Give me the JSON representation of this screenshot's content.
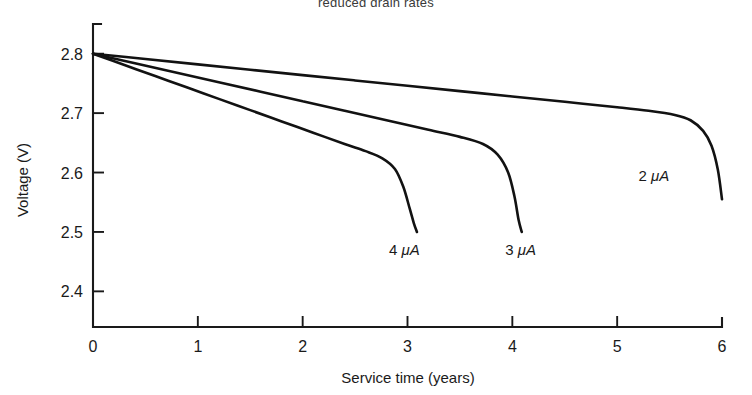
{
  "chart_data": {
    "type": "line",
    "title": "reduced drain rates",
    "xlabel": "Service time (years)",
    "ylabel": "Voltage (V)",
    "xlim": [
      0,
      6
    ],
    "ylim": [
      2.34,
      2.85
    ],
    "grid": false,
    "legend_position": "inline-annotations",
    "xticks": [
      "0",
      "1",
      "2",
      "3",
      "4",
      "5",
      "6"
    ],
    "xtick_values": [
      0,
      1,
      2,
      3,
      4,
      5,
      6
    ],
    "yticks": [
      "2.8",
      "2.7",
      "2.6",
      "2.5",
      "2.4"
    ],
    "ytick_values": [
      2.8,
      2.7,
      2.6,
      2.5,
      2.4
    ],
    "series": [
      {
        "name": "2 μA",
        "label_prefix": "2",
        "label_unit": "μA",
        "label_x": 5.35,
        "label_y": 2.585,
        "x": [
          0,
          0.5,
          1.0,
          1.5,
          2.0,
          2.5,
          3.0,
          3.5,
          4.0,
          4.5,
          5.0,
          5.3,
          5.55,
          5.7,
          5.82,
          5.9,
          5.96,
          6.0
        ],
        "values": [
          2.8,
          2.791,
          2.782,
          2.773,
          2.764,
          2.755,
          2.746,
          2.737,
          2.728,
          2.719,
          2.71,
          2.704,
          2.697,
          2.688,
          2.67,
          2.645,
          2.605,
          2.555
        ]
      },
      {
        "name": "3 μA",
        "label_prefix": "3",
        "label_unit": "μA",
        "label_x": 4.08,
        "label_y": 2.462,
        "x": [
          0,
          0.4,
          0.8,
          1.2,
          1.6,
          2.0,
          2.4,
          2.8,
          3.2,
          3.5,
          3.72,
          3.86,
          3.96,
          4.02,
          4.06,
          4.09
        ],
        "values": [
          2.8,
          2.784,
          2.768,
          2.752,
          2.736,
          2.72,
          2.704,
          2.688,
          2.672,
          2.66,
          2.648,
          2.63,
          2.6,
          2.56,
          2.52,
          2.5
        ]
      },
      {
        "name": "4 μA",
        "label_prefix": "4",
        "label_unit": "μA",
        "label_x": 2.97,
        "label_y": 2.462,
        "x": [
          0,
          0.3,
          0.6,
          0.9,
          1.2,
          1.5,
          1.8,
          2.1,
          2.4,
          2.6,
          2.76,
          2.88,
          2.96,
          3.02,
          3.06,
          3.09
        ],
        "values": [
          2.8,
          2.781,
          2.762,
          2.743,
          2.724,
          2.705,
          2.686,
          2.667,
          2.648,
          2.636,
          2.624,
          2.606,
          2.576,
          2.54,
          2.515,
          2.5
        ]
      }
    ]
  },
  "colors": {
    "curve": "#121212",
    "axis": "#1a1a1a",
    "background": "#ffffff",
    "title_text": "#3a3a3a"
  }
}
